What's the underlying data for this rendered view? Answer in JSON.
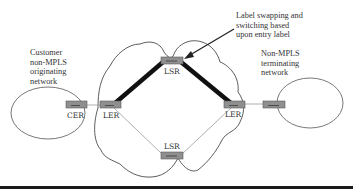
{
  "diagram": {
    "annotations": {
      "originating_network": "Customer\nnon-MPLS\noriginating\nnetwork",
      "terminating_network": "Non-MPLS\nterminating\nnetwork",
      "swap_note": "Label swapping and\nswitching based\nupon entry label"
    },
    "nodes": {
      "cer": {
        "label": "CER"
      },
      "ler_left": {
        "label": "LER"
      },
      "lsr_top": {
        "label": "LSR"
      },
      "ler_right": {
        "label": "LER"
      },
      "lsr_bottom": {
        "label": "LSR"
      }
    },
    "colors": {
      "router_fill": "#8f8f8f",
      "router_stroke": "#5a5a5a",
      "thick_path": "#111111",
      "thin_link": "#9a9a9a",
      "outline": "#333333"
    }
  }
}
